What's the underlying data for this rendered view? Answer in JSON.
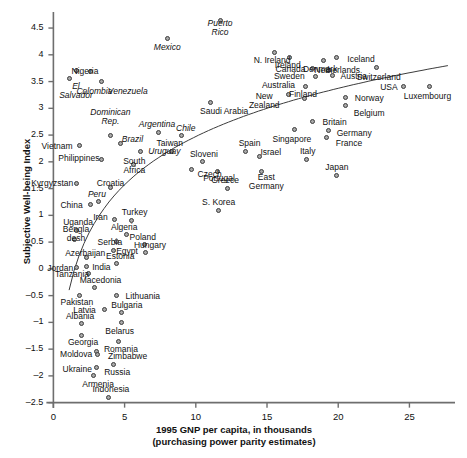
{
  "chart_data": {
    "type": "scatter",
    "title": "",
    "xlabel": "1995 GNP per capita, in thousands",
    "xlabel_line2": "(purchasing power parity estimates)",
    "ylabel": "Subjective Well-being Index",
    "xlim": [
      -0.8,
      28.2
    ],
    "ylim": [
      -2.6,
      4.8
    ],
    "xticks": [
      "0",
      "5",
      "10",
      "15",
      "20",
      "25"
    ],
    "xtick_values": [
      0,
      5,
      10,
      15,
      20,
      25
    ],
    "yticks": [
      "4.5",
      "4",
      "3.5",
      "3",
      "2.5",
      "2",
      "1.5",
      "1",
      "0.5",
      "0",
      "–0.5",
      "–1",
      "–1.5",
      "–2",
      "–2.5"
    ],
    "ytick_values": [
      4.5,
      4,
      3.5,
      3,
      2.5,
      2,
      1.5,
      1,
      0.5,
      0,
      -0.5,
      -1,
      -1.5,
      -2,
      -2.5
    ],
    "grid": false,
    "legend": "none",
    "marker": {
      "fill": "#a8a8a8",
      "stroke": "#3c3c3c",
      "size": 5
    },
    "trend": {
      "type": "logarithmic-fit-curve",
      "stroke": "#3c3c3c",
      "width": 1
    },
    "points": [
      {
        "label": "Puerto Rico",
        "x": 11.7,
        "y": 4.65,
        "italic": true,
        "lx": 0,
        "ly": 8,
        "align": "center"
      },
      {
        "label": "Mexico",
        "x": 8.0,
        "y": 4.3,
        "italic": true,
        "lx": 0,
        "ly": 9,
        "align": "center"
      },
      {
        "label": "El Salvador",
        "x": 1.6,
        "y": 3.7,
        "italic": true,
        "lx": 0,
        "ly": 20,
        "align": "center"
      },
      {
        "label": "Colombia",
        "x": 2.6,
        "y": 3.68,
        "italic": true,
        "lx": 4,
        "ly": 20,
        "align": "center"
      },
      {
        "label": "Nigeria",
        "x": 1.1,
        "y": 3.55,
        "italic": false,
        "lx": 16,
        "ly": -7,
        "align": "center"
      },
      {
        "label": "Venezuela",
        "x": 3.4,
        "y": 3.5,
        "italic": true,
        "lx": 26,
        "ly": 10,
        "align": "center"
      },
      {
        "label": "N. Ireland",
        "x": 15.5,
        "y": 4.05,
        "italic": false,
        "lx": -2,
        "ly": 8,
        "align": "center"
      },
      {
        "label": "Ireland",
        "x": 16.6,
        "y": 3.95,
        "italic": false,
        "lx": -2,
        "ly": 8,
        "align": "center"
      },
      {
        "label": "Denmark",
        "x": 19.0,
        "y": 3.9,
        "italic": false,
        "lx": -4,
        "ly": 9,
        "align": "center"
      },
      {
        "label": "Iceland",
        "x": 19.9,
        "y": 3.95,
        "italic": false,
        "lx": 24,
        "ly": 2,
        "align": "center"
      },
      {
        "label": "Canada",
        "x": 18.2,
        "y": 3.75,
        "italic": false,
        "lx": -22,
        "ly": 1,
        "align": "center"
      },
      {
        "label": "Netherlands",
        "x": 19.3,
        "y": 3.7,
        "italic": false,
        "lx": 9,
        "ly": 0,
        "align": "center"
      },
      {
        "label": "Switzerland",
        "x": 22.7,
        "y": 3.76,
        "italic": false,
        "lx": 2,
        "ly": 10,
        "align": "center"
      },
      {
        "label": "Sweden",
        "x": 18.4,
        "y": 3.6,
        "italic": false,
        "lx": -26,
        "ly": 0,
        "align": "center"
      },
      {
        "label": "Austria",
        "x": 19.6,
        "y": 3.62,
        "italic": false,
        "lx": 21,
        "ly": 1,
        "align": "center"
      },
      {
        "label": "Australia",
        "x": 17.7,
        "y": 3.4,
        "italic": false,
        "lx": -27,
        "ly": -1,
        "align": "center"
      },
      {
        "label": "USA",
        "x": 24.6,
        "y": 3.4,
        "italic": false,
        "lx": -15,
        "ly": 1,
        "align": "center"
      },
      {
        "label": "Luxembourg",
        "x": 26.4,
        "y": 3.4,
        "italic": false,
        "lx": -2,
        "ly": 10,
        "align": "center"
      },
      {
        "label": "New Zealand",
        "x": 16.5,
        "y": 3.25,
        "italic": false,
        "lx": -24,
        "ly": 6,
        "align": "center"
      },
      {
        "label": "Finland",
        "x": 17.6,
        "y": 3.18,
        "italic": false,
        "lx": -1,
        "ly": -4,
        "align": "center"
      },
      {
        "label": "Norway",
        "x": 20.5,
        "y": 3.2,
        "italic": false,
        "lx": 24,
        "ly": 1,
        "align": "center"
      },
      {
        "label": "Belgium",
        "x": 20.5,
        "y": 3.05,
        "italic": false,
        "lx": 24,
        "ly": 8,
        "align": "center"
      },
      {
        "label": "Saudi Arabia",
        "x": 11.0,
        "y": 3.1,
        "italic": false,
        "lx": 14,
        "ly": 9,
        "align": "center"
      },
      {
        "label": "Britain",
        "x": 18.2,
        "y": 2.75,
        "italic": false,
        "lx": 22,
        "ly": 1,
        "align": "center"
      },
      {
        "label": "Germany",
        "x": 19.3,
        "y": 2.58,
        "italic": false,
        "lx": 26,
        "ly": 3,
        "align": "center"
      },
      {
        "label": "France",
        "x": 19.2,
        "y": 2.45,
        "italic": false,
        "lx": 22,
        "ly": 6,
        "align": "center"
      },
      {
        "label": "Singapore",
        "x": 16.9,
        "y": 2.6,
        "italic": false,
        "lx": -2,
        "ly": 10,
        "align": "center"
      },
      {
        "label": "Dominican Rep.",
        "x": 4.0,
        "y": 2.5,
        "italic": true,
        "lx": 0,
        "ly": -18,
        "align": "center"
      },
      {
        "label": "Argentina",
        "x": 7.4,
        "y": 2.55,
        "italic": true,
        "lx": -2,
        "ly": -8,
        "align": "center"
      },
      {
        "label": "Chile",
        "x": 9.0,
        "y": 2.5,
        "italic": true,
        "lx": 4,
        "ly": -7,
        "align": "center"
      },
      {
        "label": "Brazil",
        "x": 4.7,
        "y": 2.35,
        "italic": true,
        "lx": 12,
        "ly": -4,
        "align": "center"
      },
      {
        "label": "Vietnam",
        "x": 1.8,
        "y": 2.3,
        "italic": false,
        "lx": -22,
        "ly": 1,
        "align": "center"
      },
      {
        "label": "Uruguay",
        "x": 6.1,
        "y": 2.2,
        "italic": true,
        "lx": 24,
        "ly": 0,
        "align": "center"
      },
      {
        "label": "Taiwan",
        "x": 8.3,
        "y": 2.2,
        "italic": false,
        "lx": -2,
        "ly": -8,
        "align": "center"
      },
      {
        "label": "Spain",
        "x": 13.5,
        "y": 2.2,
        "italic": false,
        "lx": 4,
        "ly": -8,
        "align": "center"
      },
      {
        "label": "Israel",
        "x": 14.5,
        "y": 2.1,
        "italic": false,
        "lx": 11,
        "ly": -4,
        "align": "center"
      },
      {
        "label": "Italy",
        "x": 17.8,
        "y": 2.05,
        "italic": false,
        "lx": 1,
        "ly": -8,
        "align": "center"
      },
      {
        "label": "Philippines",
        "x": 3.4,
        "y": 2.05,
        "italic": false,
        "lx": -23,
        "ly": -1,
        "align": "center"
      },
      {
        "label": "Sloveni",
        "x": 10.5,
        "y": 2.0,
        "italic": false,
        "lx": 1,
        "ly": -7,
        "align": "center"
      },
      {
        "label": "South Africa",
        "x": 5.6,
        "y": 1.95,
        "italic": false,
        "lx": 1,
        "ly": 1,
        "align": "center"
      },
      {
        "label": "Portugal",
        "x": 11.5,
        "y": 1.82,
        "italic": false,
        "lx": 2,
        "ly": 7,
        "align": "center"
      },
      {
        "label": "Czech",
        "x": 9.7,
        "y": 1.85,
        "italic": false,
        "lx": 18,
        "ly": 5,
        "align": "center"
      },
      {
        "label": "East Germany",
        "x": 14.6,
        "y": 1.82,
        "italic": false,
        "lx": 5,
        "ly": 11,
        "align": "center"
      },
      {
        "label": "Japan",
        "x": 19.9,
        "y": 1.75,
        "italic": false,
        "lx": 0,
        "ly": -8,
        "align": "center"
      },
      {
        "label": "Kyrgyzstan",
        "x": 1.6,
        "y": 1.6,
        "italic": false,
        "lx": -24,
        "ly": 0,
        "align": "center"
      },
      {
        "label": "Croatia",
        "x": 4.0,
        "y": 1.52,
        "italic": false,
        "lx": 0,
        "ly": -4,
        "align": "center"
      },
      {
        "label": "Greece",
        "x": 12.2,
        "y": 1.5,
        "italic": false,
        "lx": -2,
        "ly": -8,
        "align": "center"
      },
      {
        "label": "Peru",
        "x": 3.2,
        "y": 1.25,
        "italic": true,
        "lx": -2,
        "ly": -7,
        "align": "center"
      },
      {
        "label": "China",
        "x": 2.6,
        "y": 1.2,
        "italic": false,
        "lx": -19,
        "ly": 1,
        "align": "center"
      },
      {
        "label": "S. Korea",
        "x": 11.6,
        "y": 1.1,
        "italic": false,
        "lx": 0,
        "ly": -8,
        "align": "center"
      },
      {
        "label": "Iran",
        "x": 4.3,
        "y": 0.92,
        "italic": false,
        "lx": -14,
        "ly": -2,
        "align": "center"
      },
      {
        "label": "Turkey",
        "x": 5.5,
        "y": 0.9,
        "italic": false,
        "lx": 3,
        "ly": -8,
        "align": "center"
      },
      {
        "label": "Uganda",
        "x": 1.6,
        "y": 0.72,
        "italic": false,
        "lx": 2,
        "ly": -8,
        "align": "center"
      },
      {
        "label": "Algeria",
        "x": 5.1,
        "y": 0.65,
        "italic": false,
        "lx": -2,
        "ly": -7,
        "align": "center"
      },
      {
        "label": "Bengladesh",
        "x": 1.5,
        "y": 0.55,
        "italic": false,
        "lx": 1,
        "ly": -5,
        "align": "center"
      },
      {
        "label": "Serbia",
        "x": 4.4,
        "y": 0.52,
        "italic": false,
        "lx": -6,
        "ly": 1,
        "align": "center"
      },
      {
        "label": "Poland",
        "x": 6.4,
        "y": 0.45,
        "italic": false,
        "lx": -2,
        "ly": -7,
        "align": "center"
      },
      {
        "label": "Egypt",
        "x": 4.2,
        "y": 0.35,
        "italic": false,
        "lx": 14,
        "ly": 1,
        "align": "center"
      },
      {
        "label": "Hungary",
        "x": 6.5,
        "y": 0.3,
        "italic": false,
        "lx": 4,
        "ly": -7,
        "align": "center"
      },
      {
        "label": "Azerbaijan",
        "x": 2.3,
        "y": 0.22,
        "italic": false,
        "lx": -1,
        "ly": -4,
        "align": "center"
      },
      {
        "label": "India",
        "x": 2.3,
        "y": 0.05,
        "italic": false,
        "lx": 15,
        "ly": 1,
        "align": "center"
      },
      {
        "label": "Jordan",
        "x": 1.6,
        "y": 0.02,
        "italic": false,
        "lx": -16,
        "ly": 1,
        "align": "center"
      },
      {
        "label": "Estonia",
        "x": 4.4,
        "y": 0.1,
        "italic": false,
        "lx": 4,
        "ly": -7,
        "align": "center"
      },
      {
        "label": "Tanzania",
        "x": 2.5,
        "y": -0.08,
        "italic": false,
        "lx": -17,
        "ly": 1,
        "align": "center"
      },
      {
        "label": "Macedonia",
        "x": 2.9,
        "y": -0.35,
        "italic": false,
        "lx": 6,
        "ly": -7,
        "align": "center"
      },
      {
        "label": "Pakistan",
        "x": 1.8,
        "y": -0.5,
        "italic": false,
        "lx": -2,
        "ly": 7,
        "align": "center"
      },
      {
        "label": "Lithuania",
        "x": 4.4,
        "y": -0.5,
        "italic": false,
        "lx": 27,
        "ly": 1,
        "align": "center"
      },
      {
        "label": "Latvia",
        "x": 3.6,
        "y": -0.75,
        "italic": false,
        "lx": -20,
        "ly": 1,
        "align": "center"
      },
      {
        "label": "Bulgaria",
        "x": 4.8,
        "y": -0.82,
        "italic": false,
        "lx": 5,
        "ly": -7,
        "align": "center"
      },
      {
        "label": "Albania",
        "x": 2.0,
        "y": -1.02,
        "italic": false,
        "lx": -2,
        "ly": -7,
        "align": "center"
      },
      {
        "label": "Belarus",
        "x": 4.8,
        "y": -1.0,
        "italic": false,
        "lx": -2,
        "ly": 9,
        "align": "center"
      },
      {
        "label": "Georgia",
        "x": 2.0,
        "y": -1.25,
        "italic": false,
        "lx": 1,
        "ly": 7,
        "align": "center"
      },
      {
        "label": "Romania",
        "x": 4.6,
        "y": -1.35,
        "italic": false,
        "lx": 2,
        "ly": 8,
        "align": "center"
      },
      {
        "label": "Moldova",
        "x": 3.0,
        "y": -1.55,
        "italic": false,
        "lx": -20,
        "ly": 3,
        "align": "center"
      },
      {
        "label": "Zimbabwe",
        "x": 3.1,
        "y": -1.6,
        "italic": false,
        "lx": 30,
        "ly": 2,
        "align": "center"
      },
      {
        "label": "Ukraine",
        "x": 3.0,
        "y": -1.85,
        "italic": false,
        "lx": -19,
        "ly": 2,
        "align": "center"
      },
      {
        "label": "Russia",
        "x": 4.2,
        "y": -1.78,
        "italic": false,
        "lx": 4,
        "ly": 8,
        "align": "center"
      },
      {
        "label": "Armenia",
        "x": 2.8,
        "y": -2.0,
        "italic": false,
        "lx": 5,
        "ly": 9,
        "align": "center"
      },
      {
        "label": "Indonesia",
        "x": 3.9,
        "y": -2.4,
        "italic": false,
        "lx": 2,
        "ly": -8,
        "align": "center"
      }
    ]
  }
}
